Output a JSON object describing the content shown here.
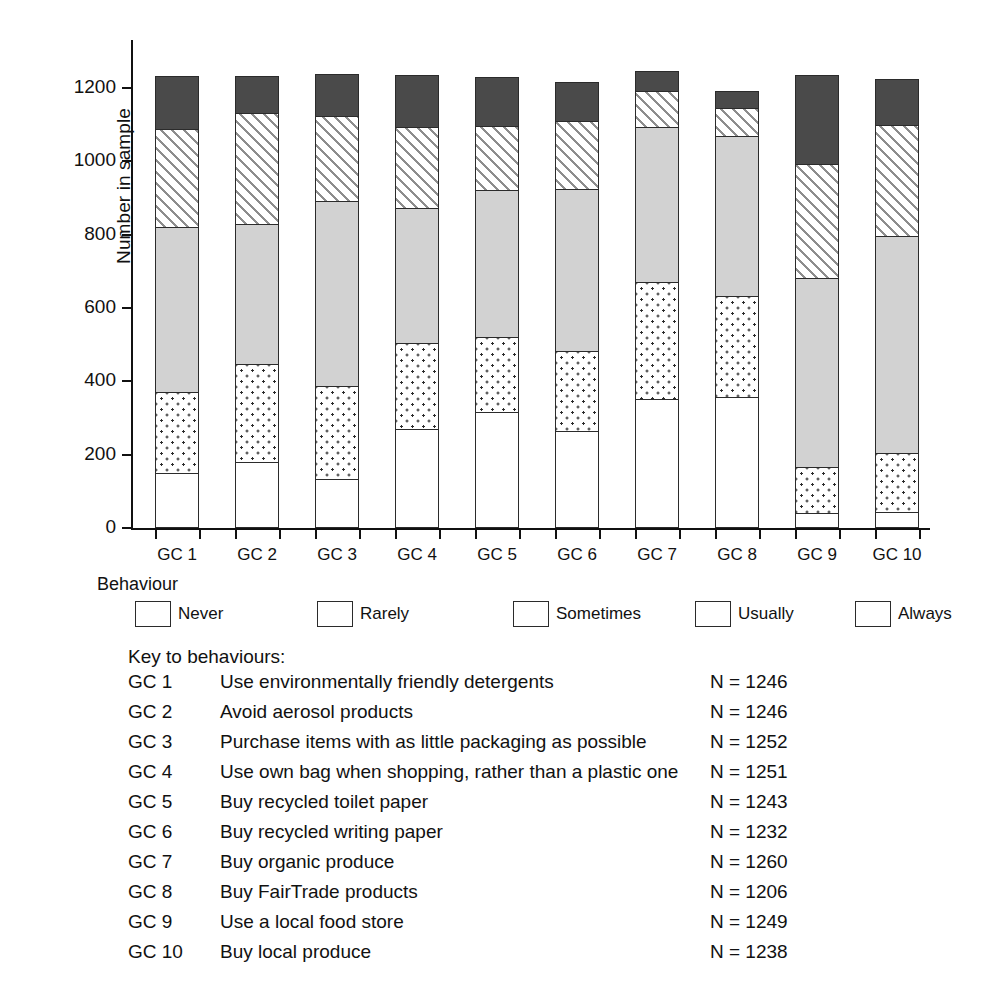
{
  "chart_data": {
    "type": "bar",
    "subtype": "stacked-bar",
    "title": "",
    "xlabel": "",
    "ylabel": "Number in sample",
    "ylim": [
      0,
      1300
    ],
    "yticks": [
      0,
      200,
      400,
      600,
      800,
      1000,
      1200
    ],
    "grid": false,
    "legend_position": "below-axis",
    "legend_title": "Behaviour",
    "stack_order_bottom_to_top": [
      "Never",
      "Rarely",
      "Sometimes",
      "Usually",
      "Always"
    ],
    "categories": [
      "GC 1",
      "GC 2",
      "GC 3",
      "GC 4",
      "GC 5",
      "GC 6",
      "GC 7",
      "GC 8",
      "GC 9",
      "GC 10"
    ],
    "series": [
      {
        "name": "Never",
        "values": [
          150,
          181,
          134,
          270,
          316,
          265,
          352,
          358,
          41,
          44
        ]
      },
      {
        "name": "Rarely",
        "values": [
          224,
          269,
          256,
          238,
          209,
          222,
          322,
          278,
          128,
          165
        ]
      },
      {
        "name": "Sometimes",
        "values": [
          453,
          387,
          509,
          371,
          404,
          444,
          428,
          439,
          519,
          595
        ]
      },
      {
        "name": "Usually",
        "values": [
          272,
          305,
          234,
          224,
          178,
          190,
          100,
          80,
          316,
          306
        ]
      },
      {
        "name": "Always",
        "values": [
          147,
          104,
          119,
          148,
          136,
          111,
          58,
          51,
          245,
          128
        ]
      }
    ],
    "totals": [
      1246,
      1246,
      1252,
      1251,
      1243,
      1232,
      1260,
      1206,
      1249,
      1238
    ],
    "colors": {
      "Never": "#ffffff",
      "Rarely": "#ffffff-dotted",
      "Sometimes": "#d2d2d2",
      "Usually": "#ffffff-hatched",
      "Always": "#4a4a4a"
    }
  },
  "axes": {
    "y_title": "Number in sample",
    "y_tick_labels": [
      "1200",
      "1000",
      "800",
      "600",
      "400",
      "200",
      "0"
    ],
    "x_tick_labels": [
      "GC 1",
      "GC 2",
      "GC 3",
      "GC 4",
      "GC 5",
      "GC 6",
      "GC 7",
      "GC 8",
      "GC 9",
      "GC 10"
    ]
  },
  "legend": {
    "title": "Behaviour",
    "items": [
      {
        "label": "Never",
        "swatch": "open-square-swatch"
      },
      {
        "label": "Rarely",
        "swatch": "dotted-square-swatch"
      },
      {
        "label": "Sometimes",
        "swatch": "grey-square-swatch"
      },
      {
        "label": "Usually",
        "swatch": "hatched-square-swatch"
      },
      {
        "label": "Always",
        "swatch": "dark-square-swatch"
      }
    ]
  },
  "key": {
    "heading": "Key to behaviours:",
    "rows": [
      {
        "code": "GC 1",
        "description": "Use environmentally friendly detergents",
        "n": "N = 1246"
      },
      {
        "code": "GC 2",
        "description": "Avoid aerosol products",
        "n": "N = 1246"
      },
      {
        "code": "GC 3",
        "description": "Purchase items with as little packaging as possible",
        "n": "N = 1252"
      },
      {
        "code": "GC 4",
        "description": "Use own bag when shopping, rather than a plastic one",
        "n": "N = 1251"
      },
      {
        "code": "GC 5",
        "description": "Buy recycled toilet paper",
        "n": "N = 1243"
      },
      {
        "code": "GC 6",
        "description": "Buy recycled writing paper",
        "n": "N = 1232"
      },
      {
        "code": "GC 7",
        "description": "Buy organic produce",
        "n": "N = 1260"
      },
      {
        "code": "GC 8",
        "description": "Buy FairTrade products",
        "n": "N = 1206"
      },
      {
        "code": "GC 9",
        "description": "Use a local food store",
        "n": "N = 1249"
      },
      {
        "code": "GC 10",
        "description": "Buy local produce",
        "n": "N = 1238"
      }
    ]
  }
}
